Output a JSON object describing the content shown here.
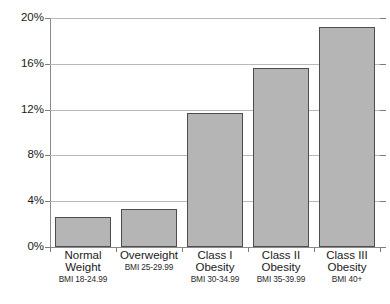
{
  "chart_data": {
    "type": "bar",
    "title": "",
    "subtitle": "",
    "xlabel": "",
    "ylabel": "",
    "ylim": [
      0,
      20
    ],
    "grid": true,
    "legend": false,
    "y_ticks": [
      "0%",
      "4%",
      "8%",
      "12%",
      "16%",
      "20%"
    ],
    "y_tick_values": [
      0,
      4,
      8,
      12,
      16,
      20
    ],
    "categories": [
      "Normal Weight",
      "Overweight",
      "Class I Obesity",
      "Class II Obesity",
      "Class III Obesity"
    ],
    "category_sublabels": [
      "BMI 18-24.99",
      "BMI 25-29.99",
      "BMI 30-34.99",
      "BMI 35-39.99",
      "BMI 40+"
    ],
    "category_lines": [
      [
        "Normal",
        "Weight"
      ],
      [
        "Overweight"
      ],
      [
        "Class I",
        "Obesity"
      ],
      [
        "Class II",
        "Obesity"
      ],
      [
        "Class III",
        "Obesity"
      ]
    ],
    "values": [
      2.6,
      3.3,
      11.7,
      15.6,
      19.2
    ],
    "value_labels": [
      "2.6%",
      "3.3%",
      "11.7%",
      "15.6%",
      "19.2%"
    ],
    "bar_color": "#b5b5b5",
    "bar_border_color": "#4d4d4d",
    "gridline_color": "#b9b9b9",
    "axis_color": "#8a8a8a",
    "background_color": "#ffffff"
  }
}
